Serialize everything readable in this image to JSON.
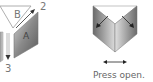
{
  "diagram": {
    "type": "folding-instructions",
    "steps": [
      {
        "id": "left",
        "labels": {
          "face_b": "B",
          "face_a": "A",
          "arrow_2": "2",
          "arrow_3": "3"
        }
      },
      {
        "id": "right",
        "caption": "Press open."
      }
    ],
    "colors": {
      "outline": "#8a8a8a",
      "panel_dark": "#6e6e6e",
      "panel_light": "#d0d0d0",
      "arrow": "#333333",
      "text": "#777777"
    }
  }
}
